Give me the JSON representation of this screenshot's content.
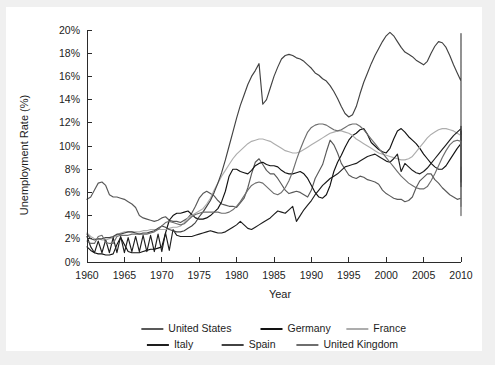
{
  "figure": {
    "background_color": "#ffffff",
    "outer_color": "#f0f0f0"
  },
  "chart_data": {
    "type": "line",
    "title": "",
    "xlabel": "Year",
    "ylabel": "Unemployment Rate (%)",
    "xlim": [
      1960,
      2010
    ],
    "ylim": [
      0,
      20
    ],
    "xticks": [
      1960,
      1965,
      1970,
      1975,
      1980,
      1985,
      1990,
      1995,
      2000,
      2005,
      2010
    ],
    "xtick_labels": [
      "1960",
      "1965",
      "1970",
      "1975",
      "1980",
      "1985",
      "1990",
      "1995",
      "2000",
      "2005",
      "2010"
    ],
    "yticks": [
      0,
      2,
      4,
      6,
      8,
      10,
      12,
      14,
      16,
      18,
      20
    ],
    "ytick_labels": [
      "0%",
      "2%",
      "4%",
      "6%",
      "8%",
      "10%",
      "12%",
      "14%",
      "16%",
      "18%",
      "20%"
    ],
    "grid": false,
    "legend_position": "bottom",
    "x_step": 0.5,
    "series": [
      {
        "name": "United States",
        "color": "#595959",
        "x_start": 1960,
        "values": [
          5.4,
          5.6,
          6.2,
          6.8,
          6.9,
          6.6,
          5.8,
          5.6,
          5.6,
          5.5,
          5.4,
          5.2,
          5.0,
          4.7,
          4.0,
          3.8,
          3.7,
          3.6,
          3.5,
          3.6,
          3.8,
          3.9,
          3.6,
          3.5,
          3.5,
          3.4,
          3.6,
          3.8,
          4.2,
          4.8,
          5.5,
          5.9,
          6.1,
          5.9,
          5.7,
          5.3,
          5.0,
          4.9,
          4.8,
          4.8,
          4.7,
          5.1,
          5.5,
          6.4,
          7.6,
          8.6,
          8.9,
          8.4,
          7.9,
          7.6,
          7.6,
          7.2,
          6.7,
          6.2,
          5.9,
          6.0,
          6.1,
          6.0,
          5.8,
          5.6,
          6.2,
          7.2,
          7.8,
          8.4,
          9.5,
          10.5,
          10.1,
          9.4,
          8.5,
          8.0,
          7.5,
          7.3,
          7.2,
          7.4,
          7.3,
          7.1,
          7.0,
          6.9,
          6.7,
          6.2,
          5.9,
          5.7,
          5.5,
          5.4,
          5.4,
          5.2,
          5.3,
          5.6,
          6.4,
          7.0,
          7.3,
          7.6,
          7.6,
          7.1,
          6.8,
          6.4,
          6.1,
          5.8,
          5.6,
          5.4,
          5.5,
          5.6,
          5.3,
          5.1,
          4.9,
          4.8,
          4.6,
          4.4,
          4.3,
          4.2,
          4.1,
          4.0,
          4.0,
          4.2,
          4.6,
          5.4,
          5.8,
          5.9,
          6.0,
          6.1,
          5.9,
          5.6,
          5.5,
          5.3,
          5.1,
          5.0,
          4.8,
          4.7,
          4.5,
          4.5,
          4.6,
          4.7,
          5.0,
          5.5,
          6.9,
          8.5,
          9.5,
          9.8,
          9.7,
          9.6,
          9.5
        ]
      },
      {
        "name": "Germany",
        "color": "#121212",
        "x_start": 1960,
        "values": [
          1.3,
          1.0,
          0.8,
          0.7,
          0.7,
          0.6,
          0.6,
          0.7,
          1.5,
          2.1,
          1.5,
          0.9,
          0.8,
          0.8,
          0.8,
          0.9,
          1.0,
          1.1,
          1.1,
          1.2,
          1.3,
          2.5,
          3.6,
          4.0,
          4.2,
          4.2,
          4.3,
          4.4,
          4.1,
          3.8,
          3.7,
          3.7,
          3.8,
          4.0,
          4.3,
          4.6,
          5.2,
          6.1,
          7.4,
          8.0,
          8.0,
          7.8,
          7.7,
          7.6,
          7.9,
          8.3,
          8.5,
          8.6,
          8.4,
          8.3,
          8.3,
          8.2,
          7.9,
          7.7,
          7.6,
          7.6,
          7.7,
          7.8,
          7.6,
          7.2,
          6.6,
          6.0,
          5.6,
          5.5,
          5.8,
          6.6,
          7.8,
          8.6,
          9.2,
          9.9,
          10.5,
          10.9,
          11.1,
          11.4,
          11.5,
          11.0,
          10.3,
          10.0,
          9.7,
          9.5,
          9.4,
          9.8,
          10.6,
          11.3,
          11.5,
          11.2,
          10.8,
          10.5,
          10.2,
          9.8,
          9.3,
          8.9,
          8.5,
          8.2,
          8.0,
          8.0,
          8.3,
          8.8,
          9.3,
          9.8,
          10.2,
          10.6,
          11.0,
          11.2,
          11.3,
          11.1,
          10.7,
          10.2,
          9.5,
          8.9,
          8.3,
          7.8,
          7.5,
          7.4,
          7.7,
          8.0,
          7.9,
          7.5,
          7.1,
          6.9,
          7.3,
          7.7,
          7.6,
          7.4,
          7.3,
          7.2,
          7.1,
          7.0,
          7.0,
          7.1,
          7.2,
          7.3,
          7.2,
          7.0
        ]
      },
      {
        "name": "France",
        "color": "#adadad",
        "x_start": 1960,
        "values": [
          2.5,
          2.2,
          2.0,
          2.0,
          1.9,
          1.9,
          2.0,
          2.1,
          2.3,
          2.5,
          2.6,
          2.6,
          2.6,
          2.6,
          2.6,
          2.7,
          2.7,
          2.8,
          2.8,
          2.8,
          2.8,
          2.8,
          2.9,
          3.0,
          3.0,
          3.1,
          3.4,
          3.8,
          4.0,
          4.2,
          4.4,
          4.6,
          5.0,
          5.5,
          6.2,
          6.8,
          7.4,
          7.9,
          8.4,
          8.9,
          9.3,
          9.6,
          9.9,
          10.2,
          10.4,
          10.5,
          10.6,
          10.6,
          10.5,
          10.4,
          10.2,
          10.0,
          9.8,
          9.6,
          9.5,
          9.4,
          9.4,
          9.5,
          9.7,
          9.9,
          10.1,
          10.3,
          10.5,
          10.7,
          10.9,
          11.1,
          11.2,
          11.3,
          11.3,
          11.2,
          11.1,
          10.9,
          10.6,
          10.4,
          10.2,
          10.0,
          9.8,
          9.6,
          9.4,
          9.3,
          9.2,
          9.1,
          9.0,
          8.9,
          8.8,
          8.8,
          8.9,
          9.1,
          9.5,
          9.9,
          10.3,
          10.7,
          11.0,
          11.2,
          11.4,
          11.5,
          11.5,
          11.4,
          11.3,
          11.1,
          10.9,
          10.7,
          10.5,
          10.3,
          10.0,
          9.7,
          9.4,
          9.2,
          9.0,
          8.8,
          8.6,
          8.4,
          8.3,
          8.3,
          8.4,
          8.6,
          8.8,
          8.9,
          9.0,
          9.1,
          9.2,
          9.3,
          9.4,
          9.5,
          9.6,
          9.7,
          9.8,
          9.9,
          10.0,
          9.9,
          9.8,
          9.7
        ]
      },
      {
        "name": "Italy",
        "color": "#1e1e1e",
        "x_start": 1960,
        "values": [
          2.2,
          1.3,
          0.8,
          1.8,
          0.8,
          1.9,
          0.8,
          2.1,
          0.8,
          2.2,
          0.8,
          2.1,
          0.9,
          2.2,
          0.9,
          2.3,
          0.9,
          2.3,
          0.9,
          2.4,
          0.9,
          2.5,
          1.0,
          2.8,
          2.3,
          2.2,
          2.2,
          2.2,
          2.2,
          2.3,
          2.4,
          2.5,
          2.6,
          2.7,
          2.6,
          2.5,
          2.5,
          2.6,
          2.8,
          3.0,
          3.2,
          3.5,
          3.2,
          2.9,
          2.8,
          3.0,
          3.2,
          3.4,
          3.6,
          3.8,
          4.1,
          4.4,
          4.3,
          4.2,
          4.5,
          4.8,
          3.5,
          4.0,
          4.5,
          4.9,
          5.3,
          5.8,
          6.2,
          6.6,
          6.9,
          7.2,
          7.4,
          7.6,
          7.9,
          8.2,
          8.3,
          8.4,
          8.5,
          8.7,
          8.9,
          9.1,
          9.2,
          9.3,
          9.1,
          8.9,
          8.7,
          8.6,
          8.9,
          9.3,
          7.8,
          8.5,
          8.2,
          7.9,
          7.7,
          7.6,
          7.8,
          8.1,
          8.5,
          8.9,
          9.3,
          9.7,
          10.1,
          10.5,
          10.9,
          11.2,
          11.5,
          11.6,
          11.7,
          11.7,
          11.6,
          11.4,
          11.2,
          11.0,
          10.8,
          10.6,
          10.4,
          10.2,
          10.0,
          9.7,
          9.5,
          9.2,
          9.0,
          8.7,
          8.4,
          8.1,
          7.9,
          7.7,
          7.4,
          7.1,
          6.9,
          6.8,
          6.7,
          6.6,
          6.5,
          6.8,
          7.4,
          8.0,
          8.4,
          8.5
        ]
      },
      {
        "name": "Spain",
        "color": "#424242",
        "x_start": 1960,
        "values": [
          2.4,
          2.0,
          1.9,
          2.0,
          2.0,
          2.1,
          2.1,
          2.2,
          2.4,
          2.4,
          2.5,
          2.6,
          2.6,
          2.5,
          2.4,
          2.5,
          2.5,
          2.6,
          2.7,
          2.9,
          3.1,
          3.0,
          2.8,
          2.7,
          2.6,
          2.6,
          2.7,
          2.9,
          3.1,
          3.4,
          3.9,
          4.3,
          4.8,
          5.3,
          6.0,
          6.8,
          7.7,
          8.8,
          10.0,
          11.2,
          12.4,
          13.5,
          14.4,
          15.3,
          16.0,
          16.5,
          17.1,
          13.6,
          14.0,
          15.0,
          16.0,
          16.8,
          17.5,
          17.8,
          17.9,
          17.8,
          17.6,
          17.5,
          17.3,
          17.0,
          16.7,
          16.3,
          16.1,
          15.8,
          15.6,
          15.2,
          14.7,
          14.1,
          13.4,
          12.8,
          12.5,
          12.7,
          13.4,
          14.5,
          15.5,
          16.3,
          17.1,
          17.8,
          18.4,
          19.0,
          19.5,
          19.8,
          19.5,
          19.0,
          18.5,
          18.1,
          17.9,
          17.7,
          17.4,
          17.2,
          17.0,
          17.3,
          18.0,
          18.6,
          19.0,
          18.9,
          18.5,
          17.8,
          17.0,
          16.3,
          15.6,
          15.0,
          14.5,
          13.9,
          13.3,
          12.7,
          12.2,
          11.8,
          11.4,
          11.0,
          10.7,
          10.5,
          10.4,
          10.4,
          10.5,
          10.7,
          11.0,
          11.1,
          11.0,
          10.6,
          10.2,
          9.8,
          9.4,
          9.0,
          8.7,
          8.5,
          8.3,
          8.2,
          8.5,
          9.5,
          11.5,
          14.0,
          17.0,
          19.0,
          19.7
        ]
      },
      {
        "name": "United Kingdom",
        "color": "#6e6e6e",
        "x_start": 1960,
        "values": [
          1.8,
          1.6,
          1.6,
          2.2,
          2.3,
          1.7,
          1.6,
          1.6,
          2.2,
          2.3,
          2.3,
          2.3,
          2.4,
          2.4,
          2.4,
          2.4,
          2.4,
          2.5,
          2.6,
          2.8,
          3.1,
          3.4,
          3.5,
          3.4,
          3.3,
          3.2,
          3.3,
          3.6,
          3.9,
          4.1,
          4.2,
          4.3,
          4.3,
          4.3,
          4.3,
          4.3,
          4.2,
          4.2,
          4.3,
          4.5,
          4.8,
          5.2,
          5.7,
          6.2,
          6.6,
          6.8,
          6.9,
          6.8,
          6.5,
          6.2,
          5.9,
          5.8,
          6.0,
          6.4,
          7.0,
          7.8,
          8.8,
          9.7,
          10.5,
          11.2,
          11.6,
          11.8,
          11.9,
          11.9,
          11.8,
          11.6,
          11.4,
          11.3,
          11.4,
          11.6,
          11.8,
          11.9,
          11.9,
          11.7,
          11.4,
          11.0,
          10.6,
          10.2,
          9.8,
          9.4,
          9.0,
          8.6,
          8.2,
          7.8,
          7.4,
          7.1,
          6.8,
          6.6,
          6.4,
          6.3,
          6.3,
          6.5,
          7.0,
          7.6,
          8.3,
          9.0,
          9.6,
          10.1,
          10.4,
          10.5,
          10.4,
          10.2,
          9.9,
          9.6,
          9.2,
          8.9,
          8.6,
          8.3,
          8.1,
          7.9,
          7.6,
          7.3,
          7.0,
          6.8,
          6.5,
          6.3,
          6.1,
          6.0,
          5.9,
          5.7,
          5.6,
          5.5,
          5.4,
          5.2,
          5.1,
          5.0,
          4.8,
          4.8,
          4.9,
          5.1,
          5.3,
          5.5,
          5.8,
          6.5,
          7.4,
          7.8,
          7.8,
          7.7
        ]
      }
    ]
  },
  "legend": {
    "rows": [
      [
        {
          "label": "United States",
          "color": "#595959"
        },
        {
          "label": "Germany",
          "color": "#121212"
        },
        {
          "label": "France",
          "color": "#adadad"
        }
      ],
      [
        {
          "label": "Italy",
          "color": "#1e1e1e"
        },
        {
          "label": "Spain",
          "color": "#424242"
        },
        {
          "label": "United Kingdom",
          "color": "#6e6e6e"
        }
      ]
    ]
  }
}
